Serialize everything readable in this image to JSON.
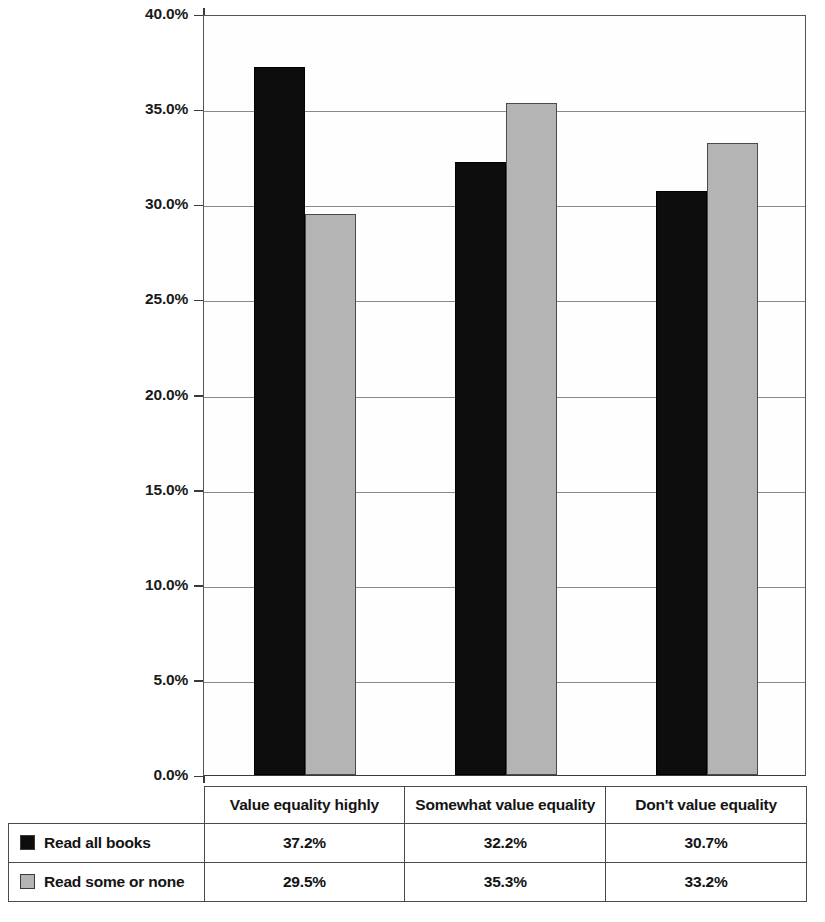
{
  "chart_data": {
    "type": "bar",
    "title": "",
    "xlabel": "",
    "ylabel": "",
    "ylim": [
      0,
      40
    ],
    "grid": true,
    "legend_position": "table-left",
    "categories": [
      "Value equality highly",
      "Somewhat value equality",
      "Don't value equality"
    ],
    "ytick_labels": [
      "40.0%",
      "35.0%",
      "30.0%",
      "25.0%",
      "20.0%",
      "15.0%",
      "10.0%",
      "5.0%",
      "0.0%"
    ],
    "ytick_values": [
      40,
      35,
      30,
      25,
      20,
      15,
      10,
      5,
      0
    ],
    "series": [
      {
        "name": "Read all books",
        "color": "#0d0d0d",
        "values": [
          37.2,
          32.2,
          30.7
        ],
        "labels": [
          "37.2%",
          "32.2%",
          "30.7%"
        ]
      },
      {
        "name": "Read some or none",
        "color": "#b4b4b4",
        "values": [
          29.5,
          35.3,
          33.2
        ],
        "labels": [
          "29.5%",
          "35.3%",
          "33.2%"
        ]
      }
    ]
  },
  "table": {
    "header_cells": [
      "Value equality highly",
      "Somewhat value equality",
      "Don't value equality"
    ],
    "rows": [
      {
        "legend_label": "Read all books",
        "swatch": "black-square-swatch",
        "cells": [
          "37.2%",
          "32.2%",
          "30.7%"
        ]
      },
      {
        "legend_label": "Read some or none",
        "swatch": "gray-square-swatch",
        "cells": [
          "29.5%",
          "35.3%",
          "33.2%"
        ]
      }
    ]
  }
}
